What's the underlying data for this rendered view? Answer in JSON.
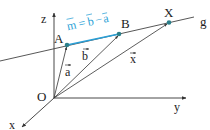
{
  "diagram": {
    "type": "vector-line-in-3d-coordinate-system",
    "colors": {
      "axes": "#333333",
      "line": "#444444",
      "direction_vector": "#2a9fd6",
      "points": "#2b7f8a"
    },
    "axes": {
      "z": "z",
      "y": "y",
      "x": "x"
    },
    "origin": "O",
    "points": {
      "A": "A",
      "B": "B",
      "X": "X"
    },
    "line_label": "g",
    "vectors": {
      "a": "a",
      "b": "b",
      "x": "x"
    },
    "direction_vector": {
      "m": "m",
      "eq": "=",
      "b": "b",
      "minus": "−",
      "a": "a"
    }
  }
}
